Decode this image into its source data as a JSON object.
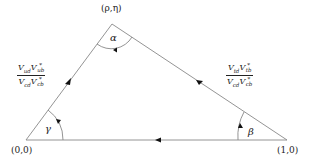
{
  "diagram": {
    "type": "unitarity-triangle",
    "vertices": {
      "origin": {
        "label": "(0,0)",
        "px": [
          26,
          140
        ]
      },
      "unit": {
        "label": "(1,0)",
        "px": [
          287,
          140
        ]
      },
      "apex": {
        "label": "(ρ,η)",
        "px": [
          112,
          24
        ]
      }
    },
    "angles": {
      "apex": "α",
      "unit": "β",
      "origin": "γ"
    },
    "sides": {
      "left": {
        "numerator": {
          "v1": "V",
          "s1": "ud",
          "v2": "V",
          "sup2": "*",
          "s2": "ub"
        },
        "denominator": {
          "v1": "V",
          "s1": "cd",
          "v2": "V",
          "sup2": "*",
          "s2": "cb"
        }
      },
      "right": {
        "numerator": {
          "v1": "V",
          "s1": "td",
          "v2": "V",
          "sup2": "*",
          "s2": "tb"
        },
        "denominator": {
          "v1": "V",
          "s1": "cd",
          "v2": "V",
          "sup2": "*",
          "s2": "cb"
        }
      }
    },
    "colors": {
      "line": "#888888",
      "text": "#222222",
      "arrow": "#111111"
    }
  }
}
